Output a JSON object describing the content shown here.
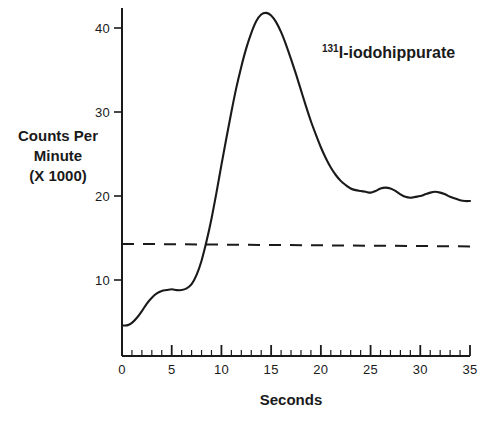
{
  "chart_data": {
    "type": "line",
    "title": "",
    "subtitle": "",
    "xlabel": "Seconds",
    "ylabel": "Counts Per Minute (X 1000)",
    "ylabel_lines": [
      "Counts Per",
      "Minute",
      "(X 1000)"
    ],
    "xlim": [
      0,
      35
    ],
    "ylim": [
      0,
      43
    ],
    "grid": false,
    "legend_position": "inside-top-right",
    "x_ticks_major": [
      0,
      5,
      10,
      15,
      20,
      25,
      30,
      35
    ],
    "x_tick_labels": [
      "0",
      "5",
      "10",
      "15",
      "20",
      "25",
      "30",
      "35"
    ],
    "x_minor_tick_interval": 1,
    "y_ticks_major": [
      10,
      20,
      30,
      40
    ],
    "y_tick_labels": [
      "10",
      "20",
      "30",
      "40"
    ],
    "series": [
      {
        "name": "131I-iodohippurate",
        "label_isotope": "131",
        "label_text": "I-iodohippurate",
        "style": "solid",
        "color": "#1a1a1a",
        "x": [
          0.0,
          0.5,
          1.0,
          1.5,
          2.0,
          2.5,
          3.0,
          3.5,
          4.0,
          4.5,
          5.0,
          5.5,
          6.0,
          6.5,
          7.0,
          7.5,
          8.0,
          8.5,
          9.0,
          9.5,
          10.0,
          10.5,
          11.0,
          11.5,
          12.0,
          12.5,
          13.0,
          13.5,
          14.0,
          14.5,
          15.0,
          15.5,
          16.0,
          16.5,
          17.0,
          17.5,
          18.0,
          18.5,
          19.0,
          19.5,
          20.0,
          20.5,
          21.0,
          21.5,
          22.0,
          22.5,
          23.0,
          23.5,
          24.0,
          24.5,
          25.0,
          25.5,
          26.0,
          26.5,
          27.0,
          27.5,
          28.0,
          28.5,
          29.0,
          29.5,
          30.0,
          30.5,
          31.0,
          31.5,
          32.0,
          32.5,
          33.0,
          33.5,
          34.0,
          34.5,
          35.0
        ],
        "y": [
          4.6,
          4.6,
          4.9,
          5.5,
          6.3,
          7.2,
          7.9,
          8.4,
          8.7,
          8.8,
          8.9,
          8.8,
          8.8,
          9.0,
          9.5,
          10.6,
          12.3,
          14.6,
          17.3,
          20.4,
          23.7,
          26.9,
          30.0,
          32.9,
          35.4,
          37.6,
          39.4,
          40.8,
          41.6,
          41.8,
          41.5,
          40.7,
          39.5,
          38.0,
          36.3,
          34.5,
          32.6,
          30.7,
          28.9,
          27.3,
          25.8,
          24.5,
          23.4,
          22.5,
          21.8,
          21.3,
          20.9,
          20.7,
          20.6,
          20.5,
          20.4,
          20.6,
          20.9,
          21.0,
          20.9,
          20.6,
          20.2,
          19.9,
          19.8,
          19.9,
          20.0,
          20.2,
          20.4,
          20.5,
          20.4,
          20.2,
          19.9,
          19.7,
          19.5,
          19.4,
          19.4
        ]
      },
      {
        "name": "baseline-reference",
        "style": "dashed",
        "color": "#1a1a1a",
        "x": [
          0,
          35
        ],
        "y": [
          14.3,
          14.0
        ]
      }
    ],
    "annotations": [
      {
        "name": "series-label",
        "isotope": "131",
        "text": "I-iodohippurate",
        "x": 21.5,
        "y": 37.5
      }
    ]
  }
}
